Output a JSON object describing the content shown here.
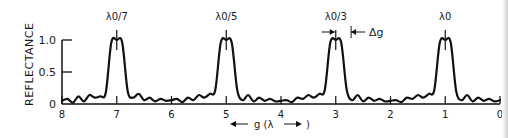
{
  "chart_data": {
    "type": "line",
    "title": "",
    "xlabel": "g (λ)",
    "xlabel_arrows": [
      "←",
      "→"
    ],
    "ylabel": "REFLECTANCE",
    "xlim": [
      8,
      0
    ],
    "ylim": [
      0,
      1.0
    ],
    "x_ticks": [
      8,
      7,
      6,
      5,
      4,
      3,
      2,
      1,
      0
    ],
    "x_tick_labels": [
      "8",
      "7",
      "6",
      "5",
      "4",
      "3",
      "2",
      "1",
      "0"
    ],
    "y_ticks": [
      0,
      0.5,
      1.0
    ],
    "y_tick_labels": [
      "0",
      "0.5",
      "1.0"
    ],
    "grid": false,
    "legend": null,
    "peaks": [
      {
        "x": 7,
        "reflectance": 1.0,
        "label": "λ0/7"
      },
      {
        "x": 5,
        "reflectance": 1.0,
        "label": "λ0/5"
      },
      {
        "x": 3,
        "reflectance": 1.0,
        "label": "λ0/3"
      },
      {
        "x": 1,
        "reflectance": 1.0,
        "label": "λ0"
      }
    ],
    "peak_half_width": 0.28,
    "sidelobe_max": 0.22,
    "annotations": [
      {
        "text": "Δg",
        "x": 3,
        "description": "peak width marker with inward arrows"
      }
    ],
    "series": [
      {
        "name": "Reflectance",
        "x": [
          8.0,
          7.9,
          7.8,
          7.7,
          7.6,
          7.5,
          7.4,
          7.3,
          7.2,
          7.1,
          7.0,
          6.9,
          6.8,
          6.7,
          6.6,
          6.5,
          6.4,
          6.3,
          6.2,
          6.1,
          6.0,
          5.9,
          5.8,
          5.7,
          5.6,
          5.5,
          5.4,
          5.3,
          5.2,
          5.1,
          5.0,
          4.9,
          4.8,
          4.7,
          4.6,
          4.5,
          4.4,
          4.3,
          4.2,
          4.1,
          4.0,
          3.9,
          3.8,
          3.7,
          3.6,
          3.5,
          3.4,
          3.3,
          3.2,
          3.1,
          3.0,
          2.9,
          2.8,
          2.7,
          2.6,
          2.5,
          2.4,
          2.3,
          2.2,
          2.1,
          2.0,
          1.9,
          1.8,
          1.7,
          1.6,
          1.5,
          1.4,
          1.3,
          1.2,
          1.1,
          1.0,
          0.9,
          0.8,
          0.7,
          0.6,
          0.5,
          0.4,
          0.3,
          0.2,
          0.1,
          0.0
        ],
        "values": [
          0.05,
          0.08,
          0.02,
          0.12,
          0.04,
          0.14,
          0.1,
          0.12,
          0.18,
          0.96,
          1.0,
          0.96,
          0.2,
          0.1,
          0.16,
          0.06,
          0.1,
          0.04,
          0.08,
          0.05,
          0.06,
          0.08,
          0.03,
          0.1,
          0.06,
          0.14,
          0.1,
          0.16,
          0.22,
          0.96,
          1.0,
          0.96,
          0.22,
          0.06,
          0.14,
          0.04,
          0.1,
          0.05,
          0.08,
          0.04,
          0.05,
          0.06,
          0.03,
          0.1,
          0.08,
          0.14,
          0.1,
          0.16,
          0.22,
          0.96,
          1.0,
          0.96,
          0.22,
          0.06,
          0.14,
          0.04,
          0.1,
          0.05,
          0.08,
          0.04,
          0.05,
          0.06,
          0.03,
          0.1,
          0.08,
          0.14,
          0.1,
          0.16,
          0.22,
          0.96,
          1.0,
          0.96,
          0.2,
          0.06,
          0.14,
          0.04,
          0.1,
          0.05,
          0.08,
          0.04,
          0.06
        ]
      }
    ]
  }
}
